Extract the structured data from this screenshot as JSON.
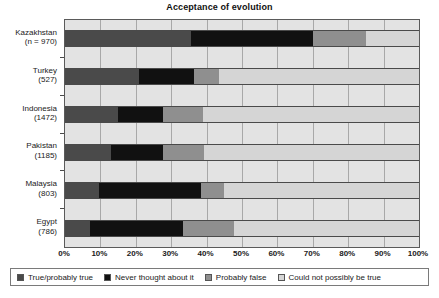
{
  "chart_data": {
    "type": "bar",
    "orientation": "horizontal",
    "stacked": true,
    "normalized": true,
    "title": "Acceptance of evolution",
    "xlabel": "",
    "ylabel": "",
    "xlim": [
      0,
      100
    ],
    "xticks": [
      "0%",
      "10%",
      "20%",
      "30%",
      "40%",
      "50%",
      "60%",
      "70%",
      "80%",
      "90%",
      "100%"
    ],
    "xtick_values": [
      0,
      10,
      20,
      30,
      40,
      50,
      60,
      70,
      80,
      90,
      100
    ],
    "grid": true,
    "legend_position": "bottom",
    "categories": [
      "Kazakhstan (n = 970)",
      "Turkey (527)",
      "Indonesia (1472)",
      "Pakistan (1185)",
      "Malaysia (803)",
      "Egypt (786)"
    ],
    "category_rows": [
      {
        "name": "Kazakhstan",
        "n_label": "(n = 970)",
        "n": 970
      },
      {
        "name": "Turkey",
        "n_label": "(527)",
        "n": 527
      },
      {
        "name": "Indonesia",
        "n_label": "(1472)",
        "n": 1472
      },
      {
        "name": "Pakistan",
        "n_label": "(1185)",
        "n": 1185
      },
      {
        "name": "Malaysia",
        "n_label": "(803)",
        "n": 803
      },
      {
        "name": "Egypt",
        "n_label": "(786)",
        "n": 786
      }
    ],
    "series": [
      {
        "name": "True/probably true",
        "color": "#4a4a4a",
        "values": [
          35.6,
          21.0,
          15.0,
          13.0,
          9.6,
          7.1
        ]
      },
      {
        "name": "Never thought about it",
        "color": "#111111",
        "values": [
          34.4,
          15.4,
          12.7,
          14.7,
          28.8,
          26.2
        ]
      },
      {
        "name": "Probably false",
        "color": "#8f8f8f",
        "values": [
          15.0,
          7.1,
          11.3,
          11.6,
          6.6,
          14.4
        ]
      },
      {
        "name": "Could not possibly be true",
        "color": "#d5d5d5",
        "values": [
          15.0,
          56.5,
          61.0,
          60.7,
          55.0,
          52.3
        ]
      }
    ]
  },
  "legend": {
    "items": [
      {
        "label": "True/probably true",
        "swatch": "sw-true"
      },
      {
        "label": "Never thought about it",
        "swatch": "sw-never"
      },
      {
        "label": "Probably false",
        "swatch": "sw-probfalse"
      },
      {
        "label": "Could not possibly be true",
        "swatch": "sw-notrue"
      }
    ]
  }
}
